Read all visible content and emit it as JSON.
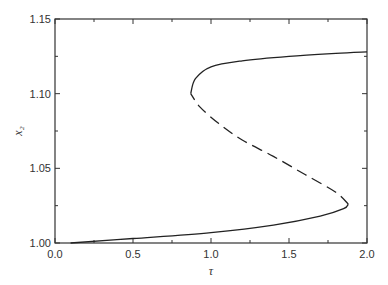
{
  "chart_data": {
    "type": "line",
    "title": "",
    "xlabel": "τ",
    "ylabel": "x₂",
    "xlim": [
      0.0,
      2.0
    ],
    "ylim": [
      1.0,
      1.15
    ],
    "grid": false,
    "legend": null,
    "x_ticks": [
      "0.0",
      "0.5",
      "1.0",
      "1.5",
      "2.0"
    ],
    "y_ticks": [
      "1.00",
      "1.05",
      "1.10",
      "1.15"
    ],
    "series": [
      {
        "name": "stable lower branch",
        "style": "solid",
        "points": [
          [
            0.1,
            1.0
          ],
          [
            0.5,
            1.003
          ],
          [
            1.0,
            1.007
          ],
          [
            1.4,
            1.012
          ],
          [
            1.7,
            1.018
          ],
          [
            1.85,
            1.023
          ],
          [
            1.88,
            1.026
          ]
        ]
      },
      {
        "name": "unstable middle branch",
        "style": "dashed",
        "points": [
          [
            1.88,
            1.026
          ],
          [
            1.8,
            1.034
          ],
          [
            1.6,
            1.046
          ],
          [
            1.4,
            1.058
          ],
          [
            1.2,
            1.069
          ],
          [
            1.05,
            1.08
          ],
          [
            0.93,
            1.091
          ],
          [
            0.87,
            1.1
          ]
        ]
      },
      {
        "name": "stable upper branch",
        "style": "solid",
        "points": [
          [
            0.87,
            1.1
          ],
          [
            0.9,
            1.11
          ],
          [
            1.0,
            1.118
          ],
          [
            1.2,
            1.122
          ],
          [
            1.5,
            1.125
          ],
          [
            1.8,
            1.127
          ],
          [
            2.0,
            1.128
          ]
        ]
      }
    ],
    "annotations": [],
    "turning_points": [
      {
        "tau": 0.86,
        "x2": 1.102
      },
      {
        "tau": 1.88,
        "x2": 1.025
      }
    ]
  },
  "colors": {
    "line": "#222222",
    "axis": "#333333",
    "background": "#ffffff"
  }
}
